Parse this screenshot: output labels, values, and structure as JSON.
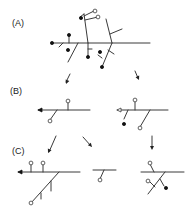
{
  "panels": [
    {
      "id": "A",
      "label": "(A)",
      "x": 12,
      "y": 24
    },
    {
      "id": "B",
      "label": "(B)",
      "x": 10,
      "y": 92
    },
    {
      "id": "C",
      "label": "(C)",
      "x": 12,
      "y": 152
    }
  ],
  "lines": [
    [
      52,
      43,
      150,
      43
    ],
    [
      88,
      43,
      84,
      14
    ],
    [
      84,
      14,
      80,
      17
    ],
    [
      84,
      16,
      94,
      11
    ],
    [
      85,
      20,
      98,
      17
    ],
    [
      112,
      43,
      106,
      19
    ],
    [
      110,
      34,
      122,
      29
    ],
    [
      69,
      43,
      69,
      36
    ],
    [
      63,
      43,
      59,
      47
    ],
    [
      78,
      43,
      68,
      62
    ],
    [
      88,
      43,
      88,
      56
    ],
    [
      88,
      49,
      92,
      49
    ],
    [
      112,
      43,
      102,
      67
    ],
    [
      102,
      58,
      98,
      55
    ],
    [
      108,
      50,
      114,
      54
    ],
    [
      70,
      74,
      66,
      82
    ],
    [
      135,
      71,
      138,
      78
    ],
    [
      38,
      110,
      90,
      110
    ],
    [
      68,
      110,
      68,
      101
    ],
    [
      57,
      110,
      50,
      120
    ],
    [
      117,
      110,
      168,
      110
    ],
    [
      135,
      110,
      135,
      101
    ],
    [
      128,
      110,
      124,
      119
    ],
    [
      150,
      110,
      140,
      127
    ],
    [
      56,
      136,
      49,
      152
    ],
    [
      83,
      137,
      91,
      146
    ],
    [
      152,
      136,
      152,
      148
    ],
    [
      18,
      172,
      80,
      172
    ],
    [
      31,
      172,
      31,
      164
    ],
    [
      43,
      172,
      43,
      164
    ],
    [
      59,
      172,
      31,
      203
    ],
    [
      51,
      181,
      51,
      191
    ],
    [
      41,
      193,
      41,
      199
    ],
    [
      93,
      170,
      116,
      170
    ],
    [
      104,
      170,
      100,
      179
    ],
    [
      141,
      172,
      184,
      172
    ],
    [
      154,
      172,
      150,
      164
    ],
    [
      165,
      172,
      148,
      194
    ],
    [
      160,
      179,
      164,
      186
    ],
    [
      155,
      187,
      150,
      182
    ]
  ],
  "filled_dots": [
    [
      52,
      43
    ],
    [
      69,
      35
    ],
    [
      68,
      50
    ],
    [
      88,
      57
    ],
    [
      100,
      52
    ],
    [
      102,
      67
    ],
    [
      81,
      18
    ],
    [
      124,
      124
    ],
    [
      166,
      188
    ]
  ],
  "open_dots": [
    [
      95,
      11
    ],
    [
      98,
      17
    ],
    [
      68,
      101
    ],
    [
      50,
      121
    ],
    [
      135,
      100
    ],
    [
      140,
      128
    ],
    [
      31,
      163
    ],
    [
      43,
      163
    ],
    [
      31,
      203
    ],
    [
      100,
      180
    ],
    [
      150,
      163
    ],
    [
      148,
      181
    ]
  ],
  "arrows": [
    {
      "from": [
        70,
        74
      ],
      "to": [
        66,
        84
      ]
    },
    {
      "from": [
        135,
        71
      ],
      "to": [
        139,
        80
      ]
    },
    {
      "from": [
        56,
        136
      ],
      "to": [
        48,
        153
      ]
    },
    {
      "from": [
        83,
        137
      ],
      "to": [
        92,
        147
      ]
    },
    {
      "from": [
        152,
        136
      ],
      "to": [
        152,
        150
      ]
    }
  ],
  "arrow_ends": [
    {
      "at": [
        38,
        110
      ],
      "dir": "left",
      "style": "filled"
    },
    {
      "at": [
        117,
        110
      ],
      "dir": "left",
      "style": "open"
    },
    {
      "at": [
        18,
        172
      ],
      "dir": "left",
      "style": "filled"
    }
  ]
}
